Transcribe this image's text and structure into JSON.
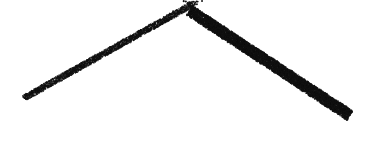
{
  "figure": {
    "title": "Stippled cone",
    "caption": "",
    "subject": "cone",
    "technique": "stipple",
    "width": 376,
    "height": 165,
    "background_color": "#ffffff",
    "ink_color": "#111111"
  },
  "geometry": {
    "apex": {
      "x": 192,
      "y": 7
    },
    "left_tip": {
      "x": 25,
      "y": 100
    },
    "right_tip": {
      "x": 352,
      "y": 112
    },
    "base_bottom": {
      "x": 222,
      "y": 155
    },
    "base_curve_sag": 44,
    "left_edge_label": "left-generator",
    "right_edge_label": "right-generator",
    "base_edge_label": "base-arc"
  },
  "shading": {
    "light_direction": "upper-left",
    "light_angle_deg": 205,
    "min_density": 0.012,
    "max_density": 0.95,
    "gamma": 2.15,
    "dark_band_strength": 1.0,
    "dot_radius_min": 0.42,
    "dot_radius_max": 0.98,
    "rim_darkening": 0.85,
    "jitter": 0.62,
    "seed": 20240517
  },
  "chart_data": {
    "type": "scatter",
    "title": "Stippled cone",
    "xlabel": "",
    "ylabel": "",
    "xlim": [
      0,
      376
    ],
    "ylim": [
      0,
      165
    ],
    "grid": false,
    "legend": "none",
    "density_profile": {
      "x_samples": [
        25,
        60,
        95,
        130,
        165,
        192,
        225,
        260,
        290,
        320,
        352
      ],
      "density": [
        0.3,
        0.08,
        0.05,
        0.07,
        0.12,
        0.2,
        0.42,
        0.66,
        0.84,
        0.93,
        0.95
      ]
    }
  }
}
